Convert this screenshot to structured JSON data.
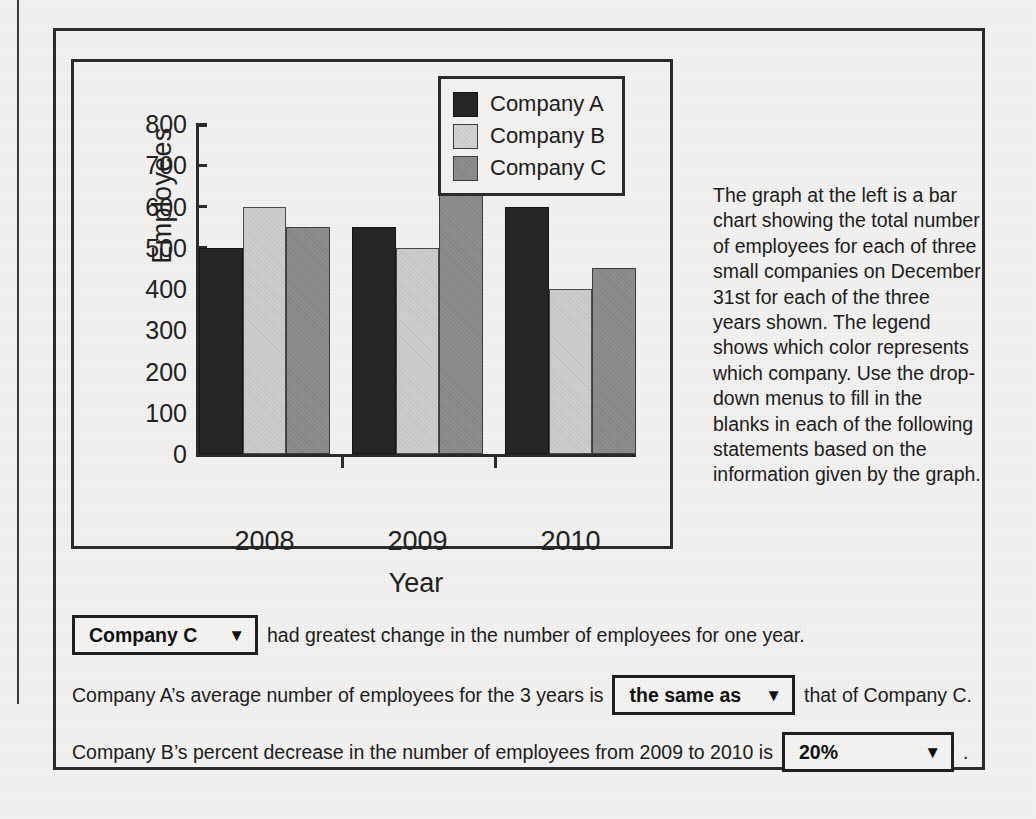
{
  "chart_data": {
    "type": "bar",
    "title": "",
    "xlabel": "Year",
    "ylabel": "Employees",
    "categories": [
      "2008",
      "2009",
      "2010"
    ],
    "series": [
      {
        "name": "Company A",
        "values": [
          500,
          550,
          600
        ],
        "color": "#262626"
      },
      {
        "name": "Company B",
        "values": [
          600,
          500,
          400
        ],
        "color": "#cfcfcf"
      },
      {
        "name": "Company C",
        "values": [
          550,
          650,
          450
        ],
        "color": "#8f8f8f"
      }
    ],
    "ylim": [
      0,
      800
    ],
    "yticks": [
      0,
      100,
      200,
      300,
      400,
      500,
      600,
      700,
      800
    ],
    "ytick_labels": [
      "0",
      "100",
      "200",
      "300",
      "400",
      "500",
      "600",
      "700",
      "800"
    ],
    "grid": false,
    "legend_position": "top-right"
  },
  "legend": {
    "entries": [
      {
        "label": "Company A"
      },
      {
        "label": "Company B"
      },
      {
        "label": "Company C"
      }
    ]
  },
  "description": {
    "text": "The graph at the left is a bar chart showing the total number of employees for each of three small companies on December 31st for each of the three years shown. The legend shows which color represents which company. Use the drop-down menus to fill in the blanks in each of the following statements based on the information given by the graph."
  },
  "statements": [
    {
      "text_before": "",
      "dropdown": {
        "value": "Company C",
        "arrow": "▼"
      },
      "text_after": "had greatest change in the number of employees for one year."
    },
    {
      "text_before": "Company A’s average number of employees for the 3 years is",
      "dropdown": {
        "value": "the same as",
        "arrow": "▼"
      },
      "text_after": "that of Company C."
    },
    {
      "text_before": "Company B’s percent decrease in the number of employees from 2009 to 2010 is",
      "dropdown": {
        "value": "20%",
        "arrow": "▼"
      },
      "text_after": "."
    }
  ]
}
